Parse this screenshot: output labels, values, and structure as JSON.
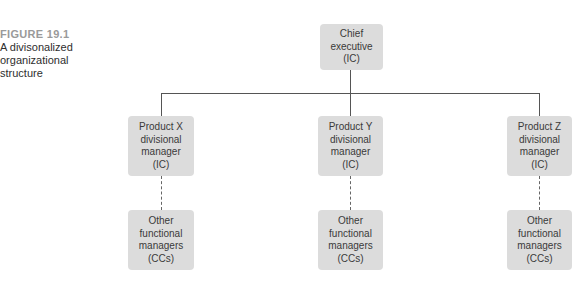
{
  "caption": {
    "figure_label": "FIGURE 19.1",
    "title_lines": [
      "A divisonalized",
      "organizational",
      "structure"
    ]
  },
  "chief": {
    "lines": [
      "Chief",
      "executive",
      "(IC)"
    ]
  },
  "divisions": [
    {
      "manager_lines": [
        "Product X",
        "divisional",
        "manager",
        "(IC)"
      ],
      "functional_lines": [
        "Other",
        "functional",
        "managers",
        "(CCs)"
      ]
    },
    {
      "manager_lines": [
        "Product Y",
        "divisional",
        "manager",
        "(IC)"
      ],
      "functional_lines": [
        "Other",
        "functional",
        "managers",
        "(CCs)"
      ]
    },
    {
      "manager_lines": [
        "Product Z",
        "divisional",
        "manager",
        "(IC)"
      ],
      "functional_lines": [
        "Other",
        "functional",
        "managers",
        "(CCs)"
      ]
    }
  ],
  "colors": {
    "box_fill": "#dcdcdc",
    "line": "#555555",
    "figure_label": "#9a9a9a"
  }
}
